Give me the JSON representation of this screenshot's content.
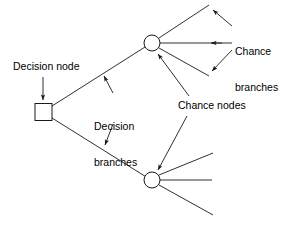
{
  "figure": {
    "type": "decision-tree-schematic",
    "background_color": "#ffffff",
    "stroke_color": "#1a1a1a",
    "text_color": "#000000"
  },
  "labels": {
    "decision_node": "Decision node",
    "decision_branches_line1": "Decision",
    "decision_branches_line2": "branches",
    "chance_branches_line1": "Chance",
    "chance_branches_line2": "branches",
    "chance_nodes": "Chance nodes"
  },
  "nodes": [
    {
      "id": "decision-node",
      "shape": "square",
      "x": 43,
      "y": 112,
      "size": 17
    },
    {
      "id": "chance-node-upper",
      "shape": "circle",
      "x": 152,
      "y": 43,
      "radius": 8
    },
    {
      "id": "chance-node-lower",
      "shape": "circle",
      "x": 152,
      "y": 180,
      "radius": 8
    }
  ],
  "decision_branches": [
    {
      "from": "decision-node",
      "to": "chance-node-upper"
    },
    {
      "from": "decision-node",
      "to": "chance-node-lower"
    }
  ],
  "chance_branches_upper": [
    {
      "from": "chance-node-upper",
      "direction": "up-right"
    },
    {
      "from": "chance-node-upper",
      "direction": "right"
    },
    {
      "from": "chance-node-upper",
      "direction": "down-right"
    }
  ],
  "chance_branches_lower": [
    {
      "from": "chance-node-lower",
      "direction": "up-right"
    },
    {
      "from": "chance-node-lower",
      "direction": "right"
    },
    {
      "from": "chance-node-lower",
      "direction": "down-right"
    }
  ],
  "annotation_arrows": [
    {
      "name": "decision-node-pointer",
      "target": "decision-node",
      "direction": "down"
    },
    {
      "name": "decision-branch-pointer-upper",
      "target": "upper-decision-branch",
      "direction": "up-left"
    },
    {
      "name": "decision-branch-pointer-lower",
      "target": "lower-decision-branch",
      "direction": "down-left"
    },
    {
      "name": "chance-branch-pointer-top",
      "target": "upper-chance-branch-1",
      "direction": "up-left"
    },
    {
      "name": "chance-branch-pointer-middle",
      "target": "upper-chance-branch-2",
      "direction": "left"
    },
    {
      "name": "chance-branch-pointer-bottom",
      "target": "upper-chance-branch-3",
      "direction": "down-left"
    },
    {
      "name": "chance-node-pointer-upper",
      "target": "chance-node-upper",
      "direction": "up-left"
    },
    {
      "name": "chance-node-pointer-lower",
      "target": "chance-node-lower",
      "direction": "down-left"
    }
  ]
}
